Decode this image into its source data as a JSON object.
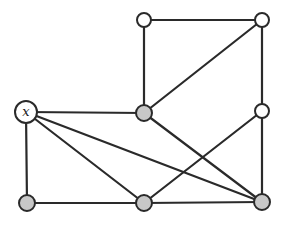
{
  "diagram": {
    "type": "graph",
    "colors": {
      "edge": "#2a2a2a",
      "white_fill": "#ffffff",
      "gray_fill": "#c8c8c8"
    },
    "nodes": [
      {
        "id": "x",
        "label": "x",
        "cx": 26,
        "cy": 112,
        "r": 11,
        "fill": "#ffffff"
      },
      {
        "id": "c",
        "label": "",
        "cx": 144,
        "cy": 113,
        "r": 8,
        "fill": "#c8c8c8"
      },
      {
        "id": "tl",
        "label": "",
        "cx": 144,
        "cy": 20,
        "r": 7,
        "fill": "#ffffff"
      },
      {
        "id": "tr",
        "label": "",
        "cx": 262,
        "cy": 20,
        "r": 7,
        "fill": "#ffffff"
      },
      {
        "id": "mr",
        "label": "",
        "cx": 262,
        "cy": 111,
        "r": 7,
        "fill": "#ffffff"
      },
      {
        "id": "bl",
        "label": "",
        "cx": 27,
        "cy": 203,
        "r": 8,
        "fill": "#c8c8c8"
      },
      {
        "id": "bm",
        "label": "",
        "cx": 144,
        "cy": 203,
        "r": 8,
        "fill": "#c8c8c8"
      },
      {
        "id": "br",
        "label": "",
        "cx": 262,
        "cy": 202,
        "r": 8,
        "fill": "#c8c8c8"
      }
    ],
    "edges": [
      [
        "x",
        "c"
      ],
      [
        "x",
        "bl"
      ],
      [
        "x",
        "bm"
      ],
      [
        "x",
        "br"
      ],
      [
        "tl",
        "tr"
      ],
      [
        "tl",
        "c"
      ],
      [
        "tr",
        "c"
      ],
      [
        "tr",
        "mr"
      ],
      [
        "c",
        "br"
      ],
      [
        "mr",
        "bm"
      ],
      [
        "mr",
        "br"
      ],
      [
        "bl",
        "bm"
      ],
      [
        "bm",
        "br"
      ]
    ]
  }
}
